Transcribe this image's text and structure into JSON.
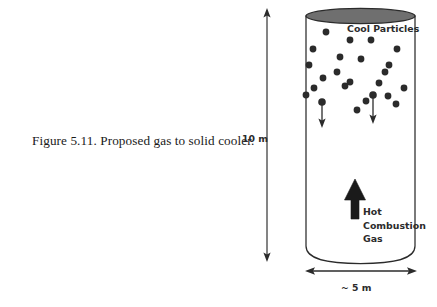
{
  "figure": {
    "caption": "Figure 5.11.  Proposed gas to solid cooler.",
    "caption_number": "5.11",
    "caption_text": "Proposed gas to solid cooler."
  },
  "diagram": {
    "title": "Proposed gas to solid cooler",
    "vessel": {
      "shape": "vertical-cylinder",
      "outline_color": "#2b2b2b",
      "fill_color": "#ffffff",
      "top_cap_fill": "#6f6f6f",
      "top_cap_stroke": "#2b2b2b"
    },
    "labels": {
      "cool_particles": "Cool Particles",
      "hot_gas_line1": "Hot",
      "hot_gas_line2": "Combustion",
      "hot_gas_line3": "Gas"
    },
    "dimensions": {
      "height_label": "10 m",
      "width_label": "~ 5 m",
      "height_value": 10,
      "width_value": 5,
      "units": "m"
    },
    "particles": {
      "label": "Cool Particles",
      "count": 24,
      "color": "#2b2b2b",
      "radius": 3.4,
      "positions": [
        [
          326,
          32
        ],
        [
          350,
          40
        ],
        [
          371,
          40
        ],
        [
          397,
          49
        ],
        [
          313,
          49
        ],
        [
          340,
          57
        ],
        [
          361,
          59
        ],
        [
          389,
          65
        ],
        [
          309,
          65
        ],
        [
          337,
          72
        ],
        [
          385,
          72
        ],
        [
          404,
          88
        ],
        [
          323,
          78
        ],
        [
          350,
          82
        ],
        [
          314,
          88
        ],
        [
          345,
          86
        ],
        [
          379,
          83
        ],
        [
          388,
          96
        ],
        [
          322,
          102
        ],
        [
          373,
          95
        ],
        [
          306,
          95
        ],
        [
          396,
          104
        ],
        [
          357,
          110
        ],
        [
          366,
          101
        ]
      ]
    },
    "particle_flow_arrows": {
      "direction": "down",
      "color": "#2b2b2b",
      "count": 2,
      "arrows": [
        {
          "x": 322,
          "y_start": 104,
          "y_end": 127
        },
        {
          "x": 373,
          "y_start": 97,
          "y_end": 124
        }
      ]
    },
    "gas_flow_arrow": {
      "direction": "up",
      "label": "Hot Combustion Gas",
      "color": "#1a1a1a",
      "x": 355,
      "y_tip": 179,
      "y_tail": 219
    }
  }
}
